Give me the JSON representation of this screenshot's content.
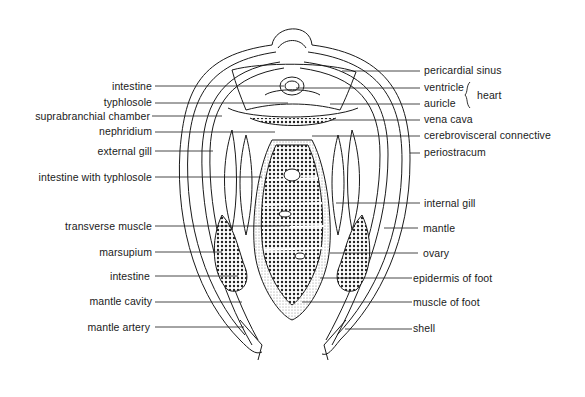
{
  "diagram": {
    "left_labels": [
      {
        "text": "intestine",
        "y": 86
      },
      {
        "text": "typhlosole",
        "y": 102
      },
      {
        "text": "suprabranchial chamber",
        "y": 116
      },
      {
        "text": "nephridium",
        "y": 131
      },
      {
        "text": "external gill",
        "y": 151
      },
      {
        "text": "intestine with typhlosole",
        "y": 177
      },
      {
        "text": "transverse muscle",
        "y": 226
      },
      {
        "text": "marsupium",
        "y": 252
      },
      {
        "text": "intestine",
        "y": 276
      },
      {
        "text": "mantle cavity",
        "y": 301
      },
      {
        "text": "mantle artery",
        "y": 327
      }
    ],
    "right_labels": [
      {
        "text": "pericardial sinus",
        "y": 70
      },
      {
        "text": "ventricle",
        "y": 87
      },
      {
        "text": "auricle",
        "y": 103
      },
      {
        "text": "vena cava",
        "y": 119
      },
      {
        "text": "cerebrovisceral connective",
        "y": 135
      },
      {
        "text": "periostracum",
        "y": 152
      },
      {
        "text": "internal gill",
        "y": 203
      },
      {
        "text": "mantle",
        "y": 228
      },
      {
        "text": "ovary",
        "y": 253
      },
      {
        "text": "epidermis of foot",
        "y": 278
      },
      {
        "text": "muscle of foot",
        "y": 302
      },
      {
        "text": "shell",
        "y": 328
      }
    ],
    "group_label": {
      "text": "heart",
      "groups": [
        "ventricle",
        "auricle"
      ]
    },
    "colors": {
      "ink": "#1a1a1a",
      "background": "#ffffff",
      "stipple": "#6b6b6b"
    }
  }
}
